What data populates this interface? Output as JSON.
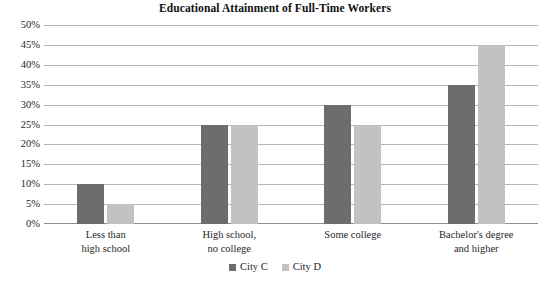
{
  "chart_data": {
    "type": "bar",
    "title": "Educational Attainment of Full-Time Workers",
    "xlabel": "",
    "ylabel": "",
    "ylim": [
      0,
      50
    ],
    "ytick_step": 5,
    "ytick_labels": [
      "50%",
      "45%",
      "40%",
      "35%",
      "30%",
      "25%",
      "20%",
      "15%",
      "10%",
      "5%",
      "0%"
    ],
    "grid": true,
    "legend_position": "bottom",
    "categories": [
      {
        "line1": "Less than",
        "line2": "high school"
      },
      {
        "line1": "High school,",
        "line2": "no college"
      },
      {
        "line1": "Some college",
        "line2": ""
      },
      {
        "line1": "Bachelor's degree",
        "line2": "and higher"
      }
    ],
    "series": [
      {
        "name": "City C",
        "color": "#6d6d6d",
        "values": [
          10,
          25,
          30,
          35
        ]
      },
      {
        "name": "City D",
        "color": "#c2c2c2",
        "values": [
          5,
          25,
          25,
          45
        ]
      }
    ]
  },
  "colors": {
    "series_c": "#6d6d6d",
    "series_d": "#c2c2c2",
    "gridline": "#b5b5b5",
    "baseline": "#8e8e8e",
    "background": "#ffffff",
    "text": "#1f1f1f"
  }
}
